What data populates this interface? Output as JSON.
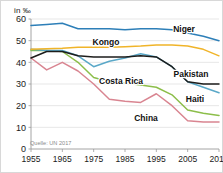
{
  "unit_label": "in ‰",
  "source": "Quelle: UN 2017",
  "labels": {
    "niger": "Niger",
    "kongo": "Kongo",
    "pakistan": "Pakistan",
    "costa_rica": "Costa Rica",
    "haiti": "Haiti",
    "china": "China"
  },
  "axis": {
    "y_ticks": [
      "0",
      "10",
      "20",
      "30",
      "40",
      "50",
      "60"
    ],
    "x_ticks": [
      "1955",
      "1965",
      "1975",
      "1985",
      "1995",
      "2005",
      "2015"
    ]
  },
  "colors": {
    "niger": "#2d7fb8",
    "kongo": "#f0b429",
    "pakistan": "#1d1d1b",
    "costa_rica": "#8cbe4a",
    "haiti": "#5aa8c8",
    "china": "#d98591",
    "grid": "#dcdcdc",
    "axis": "#9a9a9a",
    "text": "#1a1a1a",
    "source_text": "#8a8a8a",
    "background": "#ffffff"
  },
  "chart_data": {
    "type": "line",
    "title": "",
    "subtitle": "",
    "xlabel": "",
    "ylabel": "in ‰",
    "unit": "per mille",
    "source": "Quelle: UN 2017",
    "grid": true,
    "legend_position": "inline-labels",
    "xlim": [
      1955,
      2015
    ],
    "ylim": [
      0,
      60
    ],
    "y_ticks": [
      0,
      10,
      20,
      30,
      40,
      50,
      60
    ],
    "x_ticks": [
      1955,
      1965,
      1975,
      1985,
      1995,
      2005,
      2015
    ],
    "x": [
      1955,
      1960,
      1965,
      1970,
      1975,
      1980,
      1985,
      1990,
      1995,
      2000,
      2005,
      2010,
      2015
    ],
    "series": [
      {
        "name": "Niger",
        "color": "#2d7fb8",
        "values": [
          57.0,
          57.5,
          58.0,
          55.5,
          55.5,
          55.5,
          55.0,
          55.5,
          55.5,
          55.0,
          53.5,
          52.0,
          50.0
        ]
      },
      {
        "name": "Kongo",
        "color": "#f0b429",
        "values": [
          46.0,
          46.3,
          46.5,
          47.0,
          47.0,
          47.0,
          47.2,
          47.5,
          48.0,
          48.0,
          47.5,
          46.0,
          43.0
        ]
      },
      {
        "name": "Pakistan",
        "color": "#1d1d1b",
        "values": [
          42.0,
          45.0,
          45.0,
          43.0,
          42.5,
          42.5,
          42.5,
          43.0,
          42.5,
          38.0,
          31.0,
          30.0,
          30.0
        ]
      },
      {
        "name": "Costa Rica",
        "color": "#8cbe4a",
        "values": [
          45.5,
          45.5,
          45.0,
          40.0,
          33.0,
          31.0,
          30.5,
          29.5,
          28.5,
          25.0,
          18.0,
          16.5,
          15.5
        ]
      },
      {
        "name": "Haiti",
        "color": "#5aa8c8",
        "values": [
          46.0,
          45.5,
          45.5,
          43.0,
          38.0,
          40.5,
          42.0,
          44.0,
          42.5,
          38.0,
          31.0,
          28.5,
          26.0
        ]
      },
      {
        "name": "China",
        "color": "#d98591",
        "values": [
          42.0,
          36.5,
          40.0,
          36.0,
          30.0,
          23.0,
          22.0,
          21.5,
          25.5,
          20.0,
          13.0,
          12.5,
          12.5
        ]
      }
    ]
  }
}
